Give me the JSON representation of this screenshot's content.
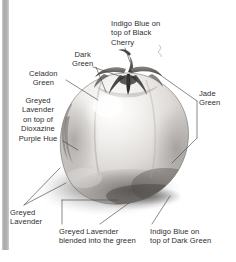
{
  "page": {
    "background_color": "#ffffff",
    "gutter_color": "#ababab",
    "text_color": "#2e2e30"
  },
  "artwork": {
    "name": "tomato-drawing",
    "description": "Graphite and colored pencil rendering of a single tomato with calyx and stem, lit from upper left, casting a soft shadow to the lower left.",
    "graphite_light": "#f0eeec",
    "graphite_mid": "#bfbcb9",
    "graphite_dark": "#6f6c6a",
    "graphite_darkest": "#3c3a39",
    "shadow_color": "#9c9a99"
  },
  "labels": [
    {
      "id": "indigo-black-cherry",
      "text": "Indigo Blue on\ntop of Black\nCherry",
      "align": "left",
      "target": "stem and deepest calyx shadow"
    },
    {
      "id": "dark-green",
      "text": "Dark\nGreen",
      "align": "center",
      "target": "calyx leaves"
    },
    {
      "id": "celadon-green",
      "text": "Celadon\nGreen",
      "align": "center",
      "target": "upper left shoulder of fruit"
    },
    {
      "id": "greyed-lavender-dioxazine",
      "text": "Greyed\nLavender\non top of\nDioxazine\nPurple Hue",
      "align": "center",
      "target": "left side core shadow of fruit"
    },
    {
      "id": "jade-green",
      "text": "Jade\nGreen",
      "align": "left",
      "target": "right shoulder and right side of fruit"
    },
    {
      "id": "greyed-lavender",
      "text": "Greyed\nLavender",
      "align": "left",
      "target": "cast shadow on table"
    },
    {
      "id": "greyed-lavender-blended",
      "text": "Greyed Lavender\nblended into the green",
      "align": "left",
      "target": "lower body where green meets shadow"
    },
    {
      "id": "indigo-dark-green",
      "text": "Indigo Blue on\ntop of Dark Green",
      "align": "left",
      "target": "darkest lower right edge of fruit"
    }
  ]
}
